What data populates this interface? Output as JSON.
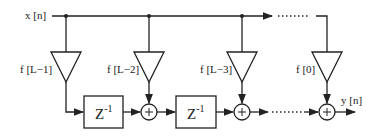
{
  "diagram": {
    "type": "FIR filter signal-flow (transposed form)",
    "input_label": "x [n]",
    "output_label": "y [n]",
    "coefficients": [
      "f [L−1]",
      "f [L−2]",
      "f [L−3]",
      "f [0]"
    ],
    "delay_label_base": "Z",
    "delay_label_exp": "-1",
    "adder_symbol": "+",
    "colors": {
      "stroke": "#222222",
      "background": "#ffffff"
    }
  }
}
